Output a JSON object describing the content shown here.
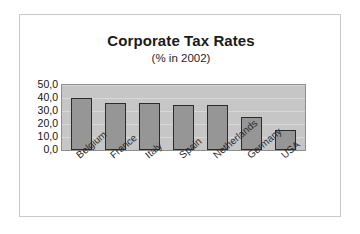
{
  "chart_data": {
    "type": "bar",
    "title": "Corporate Tax Rates",
    "subtitle": "(% in 2002)",
    "xlabel": "",
    "ylabel": "",
    "categories": [
      "Belgium",
      "France",
      "Italy",
      "Spain",
      "Netherlands",
      "Germany",
      "USA"
    ],
    "values": [
      40.2,
      36.4,
      36.0,
      35.0,
      34.5,
      25.4,
      15.7
    ],
    "ylim": [
      0,
      50
    ],
    "ytick_labels": [
      "50,0",
      "40,0",
      "30,0",
      "20,0",
      "10,0",
      "0,0"
    ],
    "ytick_values": [
      50,
      40,
      30,
      20,
      10,
      0
    ],
    "grid": true,
    "legend": false,
    "series": [
      {
        "name": "Corporate tax rate",
        "values": [
          40.2,
          36.4,
          36.0,
          35.0,
          34.5,
          25.4,
          15.7
        ]
      }
    ],
    "colors": {
      "bar_fill": "#969696",
      "bar_border": "#2b2b2b",
      "plot_background": "#c6c6c6",
      "gridline": "#d8d8d8",
      "frame_border": "#c9c9c9",
      "figure_background": "#ffffff",
      "text": "#1a1a1a"
    }
  }
}
